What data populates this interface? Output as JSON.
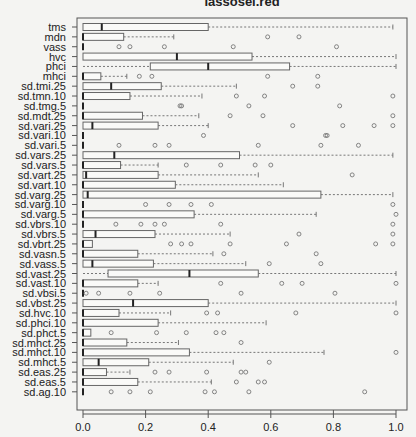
{
  "chart_data": {
    "type": "boxplot",
    "orientation": "horizontal",
    "title": "lassosel.red",
    "title_partially_visible": true,
    "xlabel": "",
    "ylabel": "",
    "xlim": [
      0,
      1
    ],
    "xticks": [
      0.0,
      0.2,
      0.4,
      0.6,
      0.8,
      1.0
    ],
    "xtick_labels": [
      "0.0",
      "0.2",
      "0.4",
      "0.6",
      "0.8",
      "1.0"
    ],
    "grid": false,
    "categories": [
      "tms",
      "mdn",
      "vass",
      "hvc",
      "phci",
      "mhci",
      "sd.tmi.25",
      "sd.tmn.10",
      "sd.tmg.5",
      "sd.mdt.25",
      "sd.vari.25",
      "sd.vari.10",
      "sd.vari.5",
      "sd.vars.25",
      "sd.vars.5",
      "sd.vart.25",
      "sd.vart.10",
      "sd.varg.25",
      "sd.varg.10",
      "sd.varg.5",
      "sd.vbrs.10",
      "sd.vbrs.5",
      "sd.vbrt.25",
      "sd.vasn.5",
      "sd.vass.5",
      "sd.vast.25",
      "sd.vast.10",
      "sd.vbsi.5",
      "sd.vbst.25",
      "sd.hvc.10",
      "sd.phci.10",
      "sd.phct.5",
      "sd.mhct.25",
      "sd.mhct.10",
      "sd.mhct.5",
      "sd.eas.25",
      "sd.eas.5",
      "sd.ag.10"
    ],
    "boxes": [
      {
        "name": "tms",
        "min": 0,
        "q1": 0,
        "median": 0.06,
        "q3": 0.4,
        "max": 0.99,
        "outliers": []
      },
      {
        "name": "mdn",
        "min": 0,
        "q1": 0,
        "median": 0,
        "q3": 0.13,
        "max": 0.29,
        "outliers": [
          0.59,
          0.69
        ]
      },
      {
        "name": "vass",
        "min": 0,
        "q1": 0,
        "median": 0,
        "q3": 0,
        "max": 0,
        "outliers": [
          0.115,
          0.15,
          0.26,
          0.48,
          0.81
        ]
      },
      {
        "name": "hvc",
        "min": 0,
        "q1": 0,
        "median": 0.3,
        "q3": 0.54,
        "max": 1.0,
        "outliers": []
      },
      {
        "name": "phci",
        "min": 0,
        "q1": 0.215,
        "median": 0.4,
        "q3": 0.66,
        "max": 1.0,
        "outliers": []
      },
      {
        "name": "mhci",
        "min": 0,
        "q1": 0,
        "median": 0,
        "q3": 0.057,
        "max": 0.14,
        "outliers": [
          0.18,
          0.22,
          0.59,
          0.75
        ]
      },
      {
        "name": "sd.tmi.25",
        "min": 0,
        "q1": 0,
        "median": 0.09,
        "q3": 0.25,
        "max": 0.49,
        "outliers": [
          0.67,
          0.75
        ]
      },
      {
        "name": "sd.tmn.10",
        "min": 0,
        "q1": 0,
        "median": 0,
        "q3": 0.15,
        "max": 0.38,
        "outliers": [
          0.49,
          0.58,
          0.99
        ]
      },
      {
        "name": "sd.tmg.5",
        "min": 0,
        "q1": 0,
        "median": 0,
        "q3": 0,
        "max": 0,
        "outliers": [
          0.31,
          0.315,
          0.53,
          0.82
        ]
      },
      {
        "name": "sd.mdt.25",
        "min": 0,
        "q1": 0,
        "median": 0,
        "q3": 0.19,
        "max": 0.37,
        "outliers": [
          0.47,
          0.575,
          0.99
        ]
      },
      {
        "name": "sd.vari.25",
        "min": 0,
        "q1": 0,
        "median": 0.03,
        "q3": 0.24,
        "max": 0.4,
        "outliers": [
          0.67,
          0.83,
          0.93,
          0.99
        ]
      },
      {
        "name": "sd.vari.10",
        "min": 0,
        "q1": 0,
        "median": 0,
        "q3": 0,
        "max": 0,
        "outliers": [
          0.385,
          0.775,
          0.78
        ]
      },
      {
        "name": "sd.vari.5",
        "min": 0,
        "q1": 0,
        "median": 0,
        "q3": 0,
        "max": 0,
        "outliers": [
          0.115,
          0.23,
          0.275,
          0.56,
          0.76,
          0.88
        ]
      },
      {
        "name": "sd.vars.25",
        "min": 0,
        "q1": 0,
        "median": 0.1,
        "q3": 0.5,
        "max": 0.99,
        "outliers": []
      },
      {
        "name": "sd.vars.5",
        "min": 0,
        "q1": 0,
        "median": 0,
        "q3": 0.12,
        "max": 0.24,
        "outliers": [
          0.33,
          0.44,
          0.55,
          0.6
        ]
      },
      {
        "name": "sd.vart.25",
        "min": 0,
        "q1": 0,
        "median": 0.01,
        "q3": 0.24,
        "max": 0.56,
        "outliers": [
          0.86
        ]
      },
      {
        "name": "sd.vart.10",
        "min": 0,
        "q1": 0,
        "median": 0,
        "q3": 0.295,
        "max": 0.64,
        "outliers": []
      },
      {
        "name": "sd.varg.25",
        "min": 0,
        "q1": 0,
        "median": 0.015,
        "q3": 0.76,
        "max": 0.99,
        "outliers": []
      },
      {
        "name": "sd.varg.10",
        "min": 0,
        "q1": 0,
        "median": 0,
        "q3": 0,
        "max": 0,
        "outliers": [
          0.2,
          0.275,
          0.345,
          0.41,
          0.99
        ]
      },
      {
        "name": "sd.varg.5",
        "min": 0,
        "q1": 0,
        "median": 0,
        "q3": 0.355,
        "max": 0.745,
        "outliers": [
          1.0
        ]
      },
      {
        "name": "sd.vbrs.10",
        "min": 0,
        "q1": 0,
        "median": 0,
        "q3": 0,
        "max": 0,
        "outliers": [
          0.105,
          0.185,
          0.23,
          0.26,
          0.44,
          0.99
        ]
      },
      {
        "name": "sd.vbrs.5",
        "min": 0,
        "q1": 0,
        "median": 0.04,
        "q3": 0.23,
        "max": 0.47,
        "outliers": [
          0.69,
          0.99
        ]
      },
      {
        "name": "sd.vbrt.25",
        "min": 0,
        "q1": 0,
        "median": 0,
        "q3": 0.03,
        "max": 0.03,
        "outliers": [
          0.28,
          0.315,
          0.345,
          0.47,
          0.65,
          0.935,
          0.99
        ]
      },
      {
        "name": "sd.vasn.5",
        "min": 0,
        "q1": 0,
        "median": 0,
        "q3": 0.175,
        "max": 0.415,
        "outliers": [
          0.45,
          0.745
        ]
      },
      {
        "name": "sd.vass.5",
        "min": 0,
        "q1": 0,
        "median": 0.03,
        "q3": 0.225,
        "max": 0.52,
        "outliers": [
          0.595,
          0.76
        ]
      },
      {
        "name": "sd.vast.25",
        "min": 0,
        "q1": 0.08,
        "median": 0.34,
        "q3": 0.56,
        "max": 1.0,
        "outliers": []
      },
      {
        "name": "sd.vast.10",
        "min": 0,
        "q1": 0,
        "median": 0,
        "q3": 0.175,
        "max": 0.24,
        "outliers": [
          0.44,
          0.635,
          0.7,
          1.0
        ]
      },
      {
        "name": "sd.vbsi.5",
        "min": 0,
        "q1": 0,
        "median": 0,
        "q3": 0,
        "max": 0,
        "outliers": [
          0.01,
          0.05,
          0.15,
          0.245,
          0.505,
          0.805
        ]
      },
      {
        "name": "sd.vbst.25",
        "min": 0,
        "q1": 0,
        "median": 0.16,
        "q3": 0.4,
        "max": 1.0,
        "outliers": []
      },
      {
        "name": "sd.hvc.10",
        "min": 0,
        "q1": 0,
        "median": 0,
        "q3": 0.115,
        "max": 0.28,
        "outliers": [
          0.395,
          0.43,
          0.68,
          1.0
        ]
      },
      {
        "name": "sd.phci.10",
        "min": 0,
        "q1": 0,
        "median": 0,
        "q3": 0.24,
        "max": 0.585,
        "outliers": []
      },
      {
        "name": "sd.phct.5",
        "min": 0,
        "q1": 0,
        "median": 0,
        "q3": 0.025,
        "max": 0.025,
        "outliers": [
          0.09,
          0.235,
          0.33,
          0.425,
          0.45
        ]
      },
      {
        "name": "sd.mhct.25",
        "min": 0,
        "q1": 0,
        "median": 0,
        "q3": 0.14,
        "max": 0.305,
        "outliers": [
          0.505
        ]
      },
      {
        "name": "sd.mhct.10",
        "min": 0,
        "q1": 0,
        "median": 0,
        "q3": 0.34,
        "max": 0.77,
        "outliers": [
          1.0
        ]
      },
      {
        "name": "sd.mhct.5",
        "min": 0,
        "q1": 0,
        "median": 0.05,
        "q3": 0.21,
        "max": 0.48,
        "outliers": [
          0.595
        ]
      },
      {
        "name": "sd.eas.25",
        "min": 0,
        "q1": 0,
        "median": 0,
        "q3": 0.075,
        "max": 0.15,
        "outliers": [
          0.23,
          0.275,
          0.395,
          0.505,
          0.52
        ]
      },
      {
        "name": "sd.eas.5",
        "min": 0,
        "q1": 0,
        "median": 0,
        "q3": 0.175,
        "max": 0.41,
        "outliers": [
          0.49,
          0.56,
          0.58
        ]
      },
      {
        "name": "sd.ag.10",
        "min": 0,
        "q1": 0,
        "median": 0,
        "q3": 0,
        "max": 0,
        "outliers": [
          0.09,
          0.15,
          0.215,
          0.39,
          0.42,
          0.53,
          0.9
        ]
      }
    ]
  },
  "style": {
    "background": "#f4f4f2",
    "frame_color": "#555555",
    "box_stroke": "#666666",
    "median_color": "#222222",
    "whisker_color": "#777777",
    "outlier_color": "#777777",
    "text_color": "#222222"
  }
}
